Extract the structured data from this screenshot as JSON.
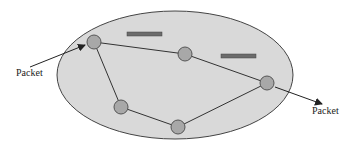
{
  "diagram": {
    "type": "packet-switched network",
    "labels": {
      "packet_in": "Packet",
      "packet_out": "Packet"
    },
    "nodes": [
      {
        "id": "n1",
        "x": 94,
        "y": 42
      },
      {
        "id": "n2",
        "x": 185,
        "y": 54
      },
      {
        "id": "n3",
        "x": 267,
        "y": 83
      },
      {
        "id": "n4",
        "x": 178,
        "y": 127
      },
      {
        "id": "n5",
        "x": 121,
        "y": 107
      }
    ],
    "links": [
      [
        "n1",
        "n2"
      ],
      [
        "n2",
        "n3"
      ],
      [
        "n3",
        "n4"
      ],
      [
        "n4",
        "n5"
      ],
      [
        "n5",
        "n1"
      ]
    ],
    "colors": {
      "network_fill": "#d9d9d9",
      "node_fill": "#a8a8a8",
      "bar_fill": "#6b6b6b",
      "line": "#333333"
    }
  }
}
